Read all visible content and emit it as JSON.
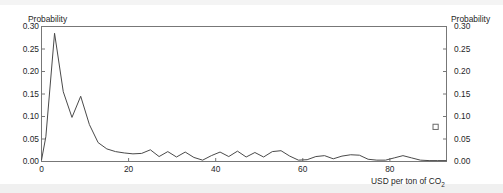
{
  "chart_data": {
    "type": "line",
    "title": "",
    "xlabel": "USD per ton of CO₂",
    "ylabel": "Probability",
    "ylabel_right": "Probability",
    "xlim": [
      0,
      93
    ],
    "ylim": [
      0.0,
      0.3
    ],
    "grid": false,
    "legend_position": "none",
    "xticks": [
      0,
      20,
      40,
      60,
      80
    ],
    "xtick_labels": [
      "0",
      "20",
      "40",
      "60",
      "80"
    ],
    "yticks": [
      0.0,
      0.05,
      0.1,
      0.15,
      0.2,
      0.25,
      0.3
    ],
    "ytick_labels": [
      "0.00",
      "0.05",
      "0.10",
      "0.15",
      "0.20",
      "0.25",
      "0.30"
    ],
    "ytick_labels_right": [
      "0.00",
      "0.05",
      "0.10",
      "0.15",
      "0.20",
      "0.25",
      "0.30"
    ],
    "line_color": "#4a4a4a",
    "series": [
      {
        "name": "Probability distribution",
        "x": [
          0,
          1,
          3,
          5,
          7,
          9,
          11,
          13,
          15,
          17,
          19,
          21,
          23,
          25,
          27,
          29,
          31,
          33,
          35,
          37,
          39,
          41,
          43,
          45,
          47,
          49,
          51,
          53,
          55,
          57,
          59,
          61,
          63,
          65,
          67,
          69,
          71,
          73,
          75,
          77,
          79,
          81,
          83,
          85,
          87,
          89,
          91,
          93
        ],
        "values": [
          0.003,
          0.055,
          0.285,
          0.155,
          0.098,
          0.145,
          0.082,
          0.042,
          0.028,
          0.022,
          0.019,
          0.017,
          0.018,
          0.026,
          0.011,
          0.022,
          0.01,
          0.021,
          0.009,
          0.003,
          0.013,
          0.021,
          0.011,
          0.023,
          0.01,
          0.02,
          0.01,
          0.022,
          0.024,
          0.012,
          0.003,
          0.004,
          0.011,
          0.013,
          0.006,
          0.012,
          0.015,
          0.014,
          0.005,
          0.003,
          0.003,
          0.008,
          0.013,
          0.008,
          0.003,
          0.002,
          0.002,
          0.002
        ]
      }
    ],
    "markers": [
      {
        "name": "open-square-marker",
        "x": 90.5,
        "y": 0.077,
        "shape": "open-square",
        "color": "#6a6a6a"
      }
    ]
  }
}
